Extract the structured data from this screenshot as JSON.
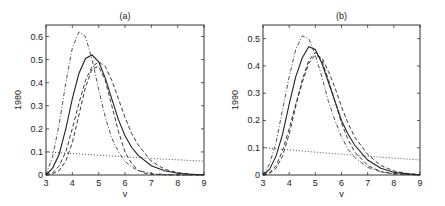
{
  "chart_data": [
    {
      "type": "line",
      "title": "(a)",
      "xlabel": "v",
      "ylabel": "1980",
      "xlim": [
        3,
        9
      ],
      "ylim": [
        0,
        0.65
      ],
      "xticks": [
        "3",
        "4",
        "5",
        "6",
        "7",
        "8",
        "9"
      ],
      "yticks": [
        "0",
        "0.1",
        "0.2",
        "0.3",
        "0.4",
        "0.5",
        "0.6"
      ],
      "grid": false,
      "series": [
        {
          "name": "solid",
          "style": "solid",
          "x": [
            3.0,
            3.25,
            3.5,
            3.75,
            4.0,
            4.25,
            4.5,
            4.75,
            5.0,
            5.25,
            5.5,
            5.75,
            6.0,
            6.25,
            6.5,
            7.0,
            7.5,
            8.0,
            8.5,
            9.0
          ],
          "y": [
            0.0,
            0.03,
            0.09,
            0.2,
            0.33,
            0.44,
            0.505,
            0.52,
            0.49,
            0.42,
            0.33,
            0.24,
            0.17,
            0.12,
            0.085,
            0.04,
            0.018,
            0.008,
            0.003,
            0.001
          ]
        },
        {
          "name": "dashed-outer",
          "style": "dashed",
          "x": [
            3.0,
            3.25,
            3.5,
            3.75,
            4.0,
            4.25,
            4.5,
            4.75,
            5.0,
            5.25,
            5.5,
            5.75,
            6.0,
            6.25,
            6.5,
            7.0,
            7.5,
            8.0,
            8.5,
            9.0
          ],
          "y": [
            0.0,
            0.01,
            0.04,
            0.1,
            0.2,
            0.31,
            0.41,
            0.47,
            0.49,
            0.47,
            0.41,
            0.33,
            0.25,
            0.18,
            0.13,
            0.06,
            0.025,
            0.01,
            0.004,
            0.001
          ]
        },
        {
          "name": "dashed-inner",
          "style": "dashed",
          "x": [
            3.0,
            3.25,
            3.5,
            3.75,
            4.0,
            4.25,
            4.5,
            4.75,
            5.0,
            5.25,
            5.5,
            5.75,
            6.0,
            6.25,
            6.5,
            6.75,
            7.0,
            7.5,
            8.0,
            9.0
          ],
          "y": [
            0.0,
            0.005,
            0.02,
            0.06,
            0.14,
            0.26,
            0.38,
            0.46,
            0.47,
            0.41,
            0.3,
            0.19,
            0.1,
            0.05,
            0.02,
            0.008,
            0.003,
            0.001,
            0.0,
            0.0
          ]
        },
        {
          "name": "dash-dot",
          "style": "dashdot",
          "x": [
            3.0,
            3.25,
            3.5,
            3.75,
            4.0,
            4.25,
            4.5,
            4.75,
            5.0,
            5.25,
            5.5,
            5.75,
            6.0,
            6.25,
            6.5,
            7.0,
            7.5,
            8.0,
            9.0
          ],
          "y": [
            0.0,
            0.08,
            0.22,
            0.4,
            0.55,
            0.62,
            0.6,
            0.5,
            0.37,
            0.25,
            0.16,
            0.1,
            0.06,
            0.035,
            0.02,
            0.007,
            0.002,
            0.001,
            0.0
          ]
        },
        {
          "name": "dotted",
          "style": "dotted",
          "x": [
            3.0,
            4.0,
            5.0,
            6.0,
            7.0,
            8.0,
            9.0
          ],
          "y": [
            0.1,
            0.093,
            0.086,
            0.079,
            0.072,
            0.066,
            0.06
          ]
        }
      ]
    },
    {
      "type": "line",
      "title": "(b)",
      "xlabel": "v",
      "ylabel": "1990",
      "xlim": [
        3,
        9
      ],
      "ylim": [
        0,
        0.55
      ],
      "xticks": [
        "3",
        "4",
        "5",
        "6",
        "7",
        "8",
        "9"
      ],
      "yticks": [
        "0",
        "0.1",
        "0.2",
        "0.3",
        "0.4",
        "0.5"
      ],
      "grid": false,
      "series": [
        {
          "name": "solid",
          "style": "solid",
          "x": [
            3.0,
            3.25,
            3.5,
            3.75,
            4.0,
            4.25,
            4.5,
            4.75,
            5.0,
            5.25,
            5.5,
            5.75,
            6.0,
            6.25,
            6.5,
            7.0,
            7.5,
            8.0,
            8.5,
            9.0
          ],
          "y": [
            0.0,
            0.02,
            0.07,
            0.15,
            0.26,
            0.36,
            0.43,
            0.47,
            0.46,
            0.41,
            0.34,
            0.27,
            0.2,
            0.15,
            0.11,
            0.055,
            0.025,
            0.01,
            0.004,
            0.001
          ]
        },
        {
          "name": "dashed-outer",
          "style": "dashed",
          "x": [
            3.0,
            3.25,
            3.5,
            3.75,
            4.0,
            4.25,
            4.5,
            4.75,
            5.0,
            5.25,
            5.5,
            5.75,
            6.0,
            6.25,
            6.5,
            7.0,
            7.5,
            8.0,
            8.5,
            9.0
          ],
          "y": [
            0.0,
            0.008,
            0.035,
            0.09,
            0.17,
            0.26,
            0.34,
            0.41,
            0.44,
            0.43,
            0.38,
            0.32,
            0.25,
            0.19,
            0.14,
            0.075,
            0.035,
            0.015,
            0.006,
            0.002
          ]
        },
        {
          "name": "dashed-inner",
          "style": "dashed",
          "x": [
            3.0,
            3.25,
            3.5,
            3.75,
            4.0,
            4.25,
            4.5,
            4.75,
            5.0,
            5.25,
            5.5,
            5.75,
            6.0,
            6.25,
            6.5,
            7.0,
            7.5,
            8.0,
            9.0
          ],
          "y": [
            0.0,
            0.005,
            0.025,
            0.07,
            0.15,
            0.25,
            0.35,
            0.42,
            0.45,
            0.42,
            0.35,
            0.27,
            0.19,
            0.13,
            0.085,
            0.035,
            0.012,
            0.004,
            0.0
          ]
        },
        {
          "name": "dash-dot",
          "style": "dashdot",
          "x": [
            3.0,
            3.25,
            3.5,
            3.75,
            4.0,
            4.25,
            4.5,
            4.75,
            5.0,
            5.25,
            5.5,
            5.75,
            6.0,
            6.25,
            6.5,
            7.0,
            7.5,
            8.0,
            9.0
          ],
          "y": [
            0.0,
            0.04,
            0.12,
            0.24,
            0.36,
            0.46,
            0.51,
            0.5,
            0.44,
            0.36,
            0.27,
            0.2,
            0.14,
            0.095,
            0.065,
            0.028,
            0.012,
            0.005,
            0.0
          ]
        },
        {
          "name": "dotted",
          "style": "dotted",
          "x": [
            3.0,
            4.0,
            5.0,
            6.0,
            7.0,
            8.0,
            9.0
          ],
          "y": [
            0.1,
            0.092,
            0.084,
            0.076,
            0.069,
            0.062,
            0.055
          ]
        }
      ]
    }
  ]
}
